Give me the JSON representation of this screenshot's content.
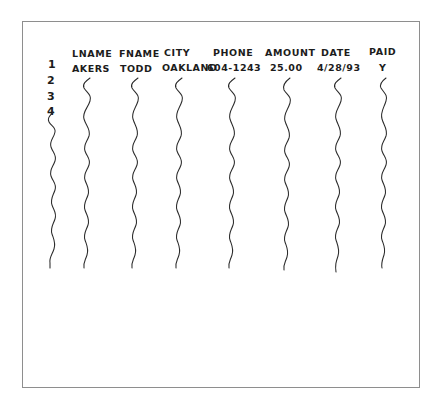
{
  "sketch": {
    "title": "hand-drawn-table-sketch",
    "frame": {
      "border_color": "#8e8e8e",
      "background": "#ffffff"
    },
    "ink_color": "#1c1c1c"
  },
  "table": {
    "row_numbers": [
      "1",
      "2",
      "3",
      "4"
    ],
    "columns": [
      {
        "header": "LNAME",
        "value": "AKERS"
      },
      {
        "header": "FNAME",
        "value": "TODD"
      },
      {
        "header": "CITY",
        "value": "OAKLAND"
      },
      {
        "header": "PHONE",
        "value": "604-1243"
      },
      {
        "header": "AMOUNT",
        "value": "25.00"
      },
      {
        "header": "DATE",
        "value": "4/28/93"
      },
      {
        "header": "PAID",
        "value": "Y"
      }
    ]
  }
}
